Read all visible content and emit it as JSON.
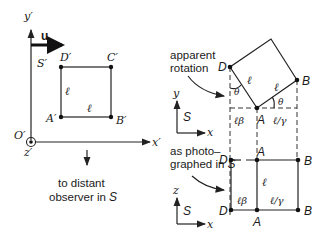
{
  "left_panel": {
    "frame_label": "S′",
    "axis_y": "y′",
    "axis_x": "x′",
    "axis_z": "z′",
    "origin": "O′",
    "velocity": "u",
    "corners": {
      "A": "A′",
      "B": "B′",
      "C": "C′",
      "D": "D′"
    },
    "side_vertical": "ℓ",
    "side_horizontal": "ℓ",
    "observer_line1": "to distant",
    "observer_line2": "observer in ",
    "observer_frame": "S"
  },
  "top_right_panel": {
    "annotation_line1": "apparent",
    "annotation_line2": "rotation",
    "corners": {
      "D": "D",
      "A": "A",
      "B": "B"
    },
    "side_left": "ℓ",
    "side_right": "ℓ",
    "angle_left": "θ",
    "angle_right": "θ",
    "proj_left": "ℓβ",
    "proj_right": "ℓ/γ",
    "axes": {
      "y": "y",
      "x": "x",
      "frame": "S"
    }
  },
  "bottom_right_panel": {
    "annotation_line1": "as photo–",
    "annotation_line2": "graphed in ",
    "annotation_frame": "S",
    "top_corners": {
      "D": "D",
      "A": "A",
      "B": "B"
    },
    "bottom_corners": {
      "D": "D",
      "A": "A",
      "B": "B"
    },
    "side_middle": "ℓ",
    "seg_left": "ℓβ",
    "seg_right": "ℓ/γ",
    "axes": {
      "z": "z",
      "x": "x",
      "frame": "S"
    }
  }
}
